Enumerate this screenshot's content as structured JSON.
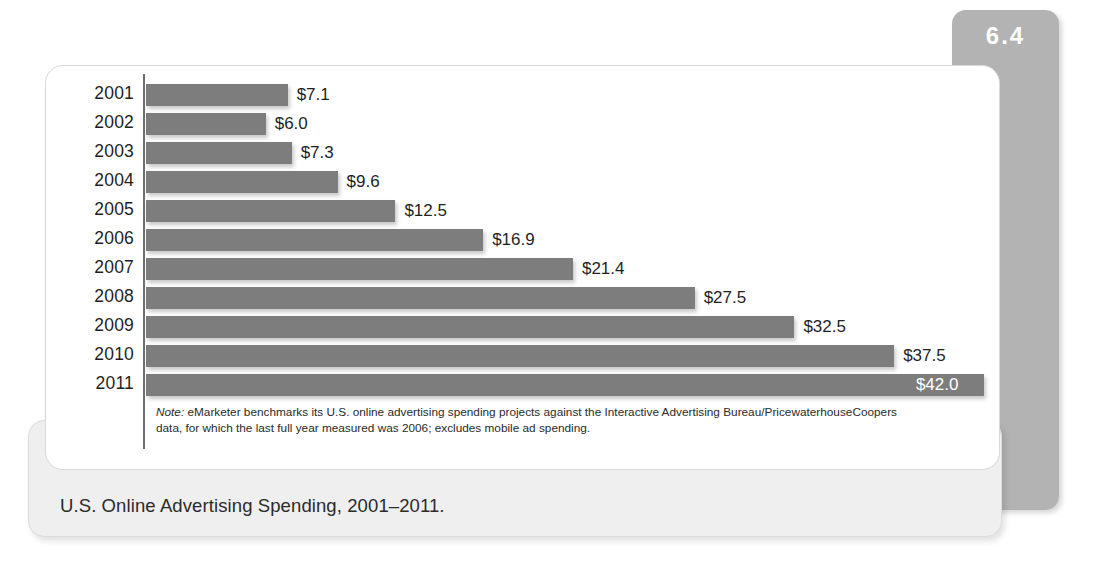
{
  "figure": {
    "number": "6.4"
  },
  "caption": {
    "text": "U.S. Online Advertising Spending, 2001–2011."
  },
  "note": {
    "prefix": "Note:",
    "body": " eMarketer benchmarks its U.S. online advertising spending projects against the Interactive Advertising Bureau/PricewaterhouseCoopers data, for which the last full year measured was 2006; excludes mobile ad spending."
  },
  "colors": {
    "bar": "#7d7d7d",
    "badge": "#b3b3b3",
    "caption_panel": "#efefef",
    "axis": "#6f6f6f",
    "card_border": "#d8d8d8",
    "text": "#1f1f1f",
    "inside_label": "#ffffff"
  },
  "chart_data": {
    "type": "bar",
    "orientation": "horizontal",
    "title": "U.S. Online Advertising Spending, 2001–2011.",
    "xlabel": "",
    "ylabel": "",
    "unit": "billions of US dollars",
    "grid": false,
    "legend": null,
    "xlim": [
      0,
      42.0
    ],
    "categories": [
      "2001",
      "2002",
      "2003",
      "2004",
      "2005",
      "2006",
      "2007",
      "2008",
      "2009",
      "2010",
      "2011"
    ],
    "values": [
      7.1,
      6.0,
      7.3,
      9.6,
      12.5,
      16.9,
      21.4,
      27.5,
      32.5,
      37.5,
      42.0
    ],
    "data_labels": [
      "$7.1",
      "$6.0",
      "$7.3",
      "$9.6",
      "$12.5",
      "$16.9",
      "$21.4",
      "$27.5",
      "$32.5",
      "$37.5",
      "$42.0"
    ],
    "label_placement": [
      "outside",
      "outside",
      "outside",
      "outside",
      "outside",
      "outside",
      "outside",
      "outside",
      "outside",
      "outside",
      "inside"
    ],
    "annotations": [
      "Note: eMarketer benchmarks its U.S. online advertising spending projects against the Interactive Advertising Bureau/PricewaterhouseCoopers data, for which the last full year measured was 2006; excludes mobile ad spending."
    ]
  }
}
